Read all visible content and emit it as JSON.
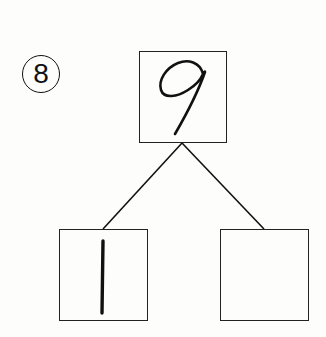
{
  "problem": {
    "number_label": "⑧",
    "number": 8
  },
  "number_bond": {
    "whole": {
      "value": "9",
      "style": "handwritten"
    },
    "parts": [
      {
        "value": "1",
        "style": "handwritten"
      },
      {
        "value": "",
        "style": "empty"
      }
    ]
  },
  "colors": {
    "ink": "#111111",
    "background": "#fdfdfc"
  }
}
